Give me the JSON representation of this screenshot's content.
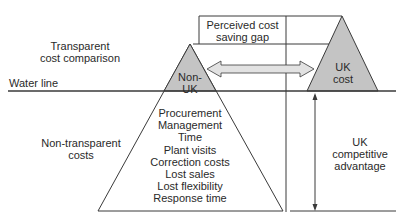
{
  "diagram": {
    "type": "iceberg-cost-comparison",
    "labels": {
      "transparent": "Transparent cost comparison",
      "transparent_line1": "Transparent",
      "transparent_line2": "cost comparison",
      "water_line": "Water line",
      "non_transparent_line1": "Non-transparent",
      "non_transparent_line2": "costs",
      "perceived_gap_line1": "Perceived cost",
      "perceived_gap_line2": "saving gap",
      "non_uk_line1": "Non-",
      "non_uk_line2": "UK",
      "uk_cost_line1": "UK",
      "uk_cost_line2": "cost",
      "uk_advantage_line1": "UK",
      "uk_advantage_line2": "competitive",
      "uk_advantage_line3": "advantage"
    },
    "hidden_costs": [
      "Procurement",
      "Management",
      "Time",
      "Plant visits",
      "Correction costs",
      "Lost sales",
      "Lost flexibility",
      "Response time"
    ],
    "colors": {
      "triangle_fill": "#c4c4c4",
      "arrow_fill": "#e2e2e2",
      "line": "#3a3a3a"
    }
  }
}
